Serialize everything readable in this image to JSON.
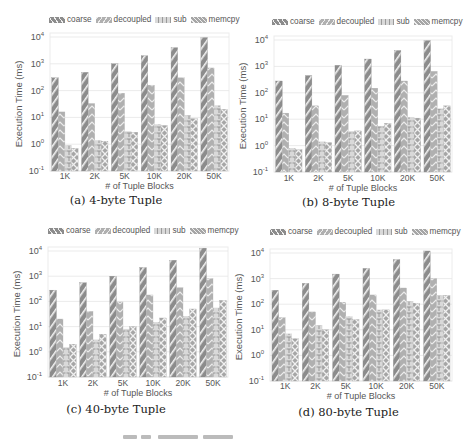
{
  "figure": {
    "legend": [
      "coarse",
      "decoupled",
      "sub",
      "memcpy"
    ],
    "colors": {
      "coarse": "#8c8c8c",
      "decoupled": "#b0b0b0",
      "sub": "#d9d9d9",
      "memcpy": "#a6a6a6",
      "grid": "#e6e6e6",
      "axis_text": "#555555"
    }
  },
  "panels": [
    {
      "caption": "(a) 4-byte Tuple",
      "xlabel": "# of Tuple Blocks",
      "ylabel": "Execution Time (ms)"
    },
    {
      "caption": "(b) 8-byte Tuple",
      "xlabel": "# of Tuple Blocks",
      "ylabel": "Execution Time (ms)"
    },
    {
      "caption": "(c) 40-byte Tuple",
      "xlabel": "# of Tuple Blocks",
      "ylabel": "Execution Time (ms)"
    },
    {
      "caption": "(d) 80-byte Tuple",
      "xlabel": "# of Tuple Blocks",
      "ylabel": "Execution Time (ms)"
    }
  ],
  "chart_data": [
    {
      "type": "bar",
      "title": "(a) 4-byte Tuple",
      "xlabel": "# of Tuple Blocks",
      "ylabel": "Execution Time (ms)",
      "yscale": "log",
      "ylim": [
        0.1,
        10000
      ],
      "yticks": [
        "10^-1",
        "10^0",
        "10^1",
        "10^2",
        "10^3",
        "10^4"
      ],
      "grid": true,
      "legend_position": "top",
      "categories": [
        "1K",
        "2K",
        "5K",
        "10K",
        "20K",
        "50K"
      ],
      "series": [
        {
          "name": "coarse",
          "values": [
            300,
            480,
            1000,
            2000,
            4000,
            9500
          ]
        },
        {
          "name": "decoupled",
          "values": [
            16,
            33,
            80,
            160,
            300,
            700
          ]
        },
        {
          "name": "sub",
          "values": [
            0.9,
            1.4,
            3.0,
            5.5,
            12,
            28
          ]
        },
        {
          "name": "memcpy",
          "values": [
            0.7,
            1.3,
            2.8,
            5.0,
            9,
            20
          ]
        }
      ]
    },
    {
      "type": "bar",
      "title": "(b) 8-byte Tuple",
      "xlabel": "# of Tuple Blocks",
      "ylabel": "Execution Time (ms)",
      "yscale": "log",
      "ylim": [
        0.1,
        10000
      ],
      "yticks": [
        "10^-1",
        "10^0",
        "10^1",
        "10^2",
        "10^3",
        "10^4"
      ],
      "grid": true,
      "legend_position": "top",
      "categories": [
        "1K",
        "2K",
        "5K",
        "10K",
        "20K",
        "50K"
      ],
      "series": [
        {
          "name": "coarse",
          "values": [
            280,
            450,
            1100,
            1900,
            4000,
            9500
          ]
        },
        {
          "name": "decoupled",
          "values": [
            17,
            32,
            80,
            150,
            280,
            650
          ]
        },
        {
          "name": "sub",
          "values": [
            0.8,
            1.4,
            3.5,
            5.5,
            12,
            25
          ]
        },
        {
          "name": "memcpy",
          "values": [
            0.7,
            1.3,
            3.6,
            7,
            11,
            32
          ]
        }
      ]
    },
    {
      "type": "bar",
      "title": "(c) 40-byte Tuple",
      "xlabel": "# of Tuple Blocks",
      "ylabel": "Execution Time (ms)",
      "yscale": "log",
      "ylim": [
        0.1,
        10000
      ],
      "yticks": [
        "10^-1",
        "10^0",
        "10^1",
        "10^2",
        "10^3",
        "10^4"
      ],
      "grid": true,
      "legend_position": "top",
      "categories": [
        "1K",
        "2K",
        "5K",
        "10K",
        "20K",
        "50K"
      ],
      "series": [
        {
          "name": "coarse",
          "values": [
            280,
            550,
            1000,
            2200,
            4300,
            13000
          ]
        },
        {
          "name": "decoupled",
          "values": [
            20,
            40,
            95,
            180,
            350,
            800
          ]
        },
        {
          "name": "sub",
          "values": [
            1.5,
            3,
            8,
            15,
            26,
            55
          ]
        },
        {
          "name": "memcpy",
          "values": [
            2,
            5,
            10,
            22,
            50,
            110
          ]
        }
      ]
    },
    {
      "type": "bar",
      "title": "(d) 80-byte Tuple",
      "xlabel": "# of Tuple Blocks",
      "ylabel": "Execution Time (ms)",
      "yscale": "log",
      "ylim": [
        0.1,
        10000
      ],
      "yticks": [
        "10^-1",
        "10^0",
        "10^1",
        "10^2",
        "10^3",
        "10^4"
      ],
      "grid": true,
      "legend_position": "top",
      "categories": [
        "1K",
        "2K",
        "5K",
        "10K",
        "20K",
        "50K"
      ],
      "series": [
        {
          "name": "coarse",
          "values": [
            350,
            650,
            1500,
            2500,
            5500,
            12000
          ]
        },
        {
          "name": "decoupled",
          "values": [
            30,
            50,
            120,
            230,
            430,
            1000
          ]
        },
        {
          "name": "sub",
          "values": [
            7,
            15,
            33,
            60,
            130,
            220
          ]
        },
        {
          "name": "memcpy",
          "values": [
            4.5,
            10,
            25,
            60,
            110,
            220
          ]
        }
      ]
    }
  ]
}
